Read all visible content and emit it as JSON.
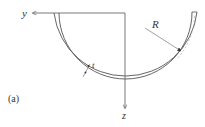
{
  "figure": {
    "panel_label": "(a)",
    "axes": {
      "horizontal": "y",
      "vertical": "z"
    },
    "dimensions": {
      "radius": "R",
      "thickness": "t"
    }
  },
  "colors": {
    "stroke": "#555555",
    "radius_arrow": "#888888",
    "text": "#333333"
  }
}
